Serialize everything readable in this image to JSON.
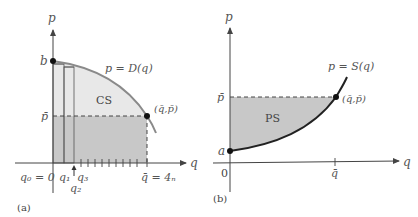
{
  "colors": {
    "axis": "#444444",
    "curve_demand": "#8a8a8a",
    "curve_supply": "#222222",
    "shade_light": "#e6e6e6",
    "shade_dark": "#c6c6c6",
    "point": "#111111",
    "dashed": "#333333"
  },
  "panel_a": {
    "caption": "(a)",
    "y_axis_label": "p",
    "x_axis_label": "q",
    "intercept_label": "b",
    "price_label": "p̄",
    "curve_label": "p = D(q)",
    "region_label": "CS",
    "equilibrium_label": "(q̄,p̄)",
    "q0_label": "q₀ = 0",
    "q1_label": "q₁",
    "q2_label": "q₂",
    "q3_label": "q₃",
    "qbar_label": "q̄ = 4ₙ",
    "tick_count": 10
  },
  "panel_b": {
    "caption": "(b)",
    "y_axis_label": "p",
    "x_axis_label": "q",
    "intercept_label": "a",
    "origin_label": "0",
    "price_label": "p̄",
    "curve_label": "p = S(q)",
    "region_label": "PS",
    "equilibrium_label": "(q̄,p̄)",
    "qbar_label": "q̄"
  }
}
